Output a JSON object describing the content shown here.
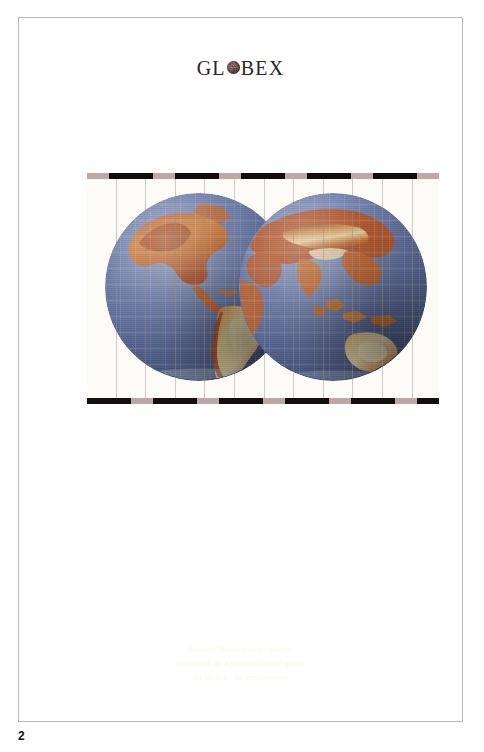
{
  "page": {
    "number": "2",
    "background_color": "#ffffff",
    "frame_color": "#b9b9b9"
  },
  "brand": {
    "prefix": "GL",
    "globe_glyph_name": "globe-sphere-icon",
    "suffix": "BEX",
    "full_text": "GLOBEX",
    "ink_color": "#2a2622",
    "globe_color": "#63403c"
  },
  "plate": {
    "name": "globe-photograph-plate",
    "strip_dark_color": "#100d0c",
    "strip_light_color": "#bda9a4",
    "panel_line_color": "#968e84",
    "panel_count": 12,
    "background_color": "#fdfbf6"
  },
  "globes": [
    {
      "name": "globe-western-hemisphere",
      "label": "Western Hemisphere",
      "ocean_color": "#5d6d9c",
      "land_colors": [
        "#c8652f",
        "#d98a46",
        "#e8c98b",
        "#a8502c",
        "#edd9a4"
      ]
    },
    {
      "name": "globe-eastern-hemisphere",
      "label": "Eastern Hemisphere",
      "ocean_color": "#5d6d9c",
      "land_colors": [
        "#c8652f",
        "#d98a46",
        "#e8c98b",
        "#8d4426",
        "#f0ddb0"
      ]
    }
  ],
  "caption": {
    "color": "#fbf8ec",
    "lines": [
      "Eastern/Western hemispheres",
      "displayed on a physical relief globe",
      "24 inches / 61 centimetres"
    ]
  }
}
